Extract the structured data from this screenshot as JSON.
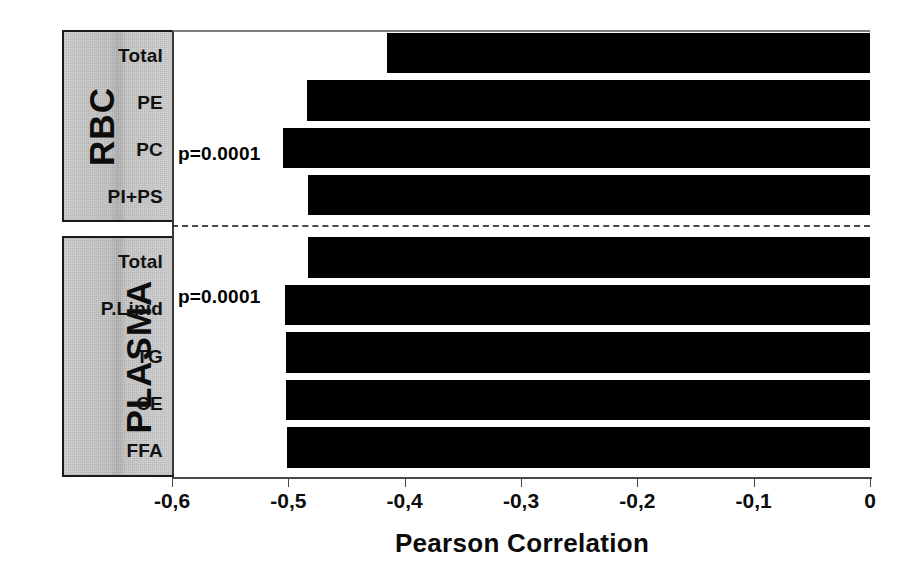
{
  "chart_data": {
    "type": "bar",
    "orientation": "horizontal",
    "title": "",
    "xlabel": "Pearson Correlation",
    "ylabel": "",
    "xlim": [
      -0.6,
      0
    ],
    "xticks": [
      -0.6,
      -0.5,
      -0.4,
      -0.3,
      -0.2,
      -0.1,
      0
    ],
    "xticklabels": [
      "-0,6",
      "-0,5",
      "-0,4",
      "-0,3",
      "-0,2",
      "-0,1",
      "0"
    ],
    "grid": false,
    "legend": null,
    "bar_color": "#000000",
    "decimal_separator_axis": ",",
    "groups": [
      {
        "name": "RBC",
        "categories": [
          "Total",
          "PE",
          "PC",
          "PI+PS"
        ],
        "values": [
          -0.415,
          -0.484,
          -0.505,
          -0.483
        ]
      },
      {
        "name": "PLASMA",
        "categories": [
          "Total",
          "P.Lipid",
          "TG",
          "CE",
          "FFA"
        ],
        "values": [
          -0.483,
          -0.503,
          -0.502,
          -0.502,
          -0.501
        ]
      }
    ],
    "categories": [
      "Total",
      "PE",
      "PC",
      "PI+PS",
      "Total",
      "P.Lipid",
      "TG",
      "CE",
      "FFA"
    ],
    "values": [
      -0.415,
      -0.484,
      -0.505,
      -0.483,
      -0.483,
      -0.503,
      -0.502,
      -0.502,
      -0.501
    ],
    "annotations": [
      {
        "text": "p=0.0001",
        "attached_to": "RBC / PC",
        "x": -0.6,
        "y_index": 2
      },
      {
        "text": "p=0.0001",
        "attached_to": "PLASMA / P.Lipid",
        "x": -0.6,
        "y_index": 5
      }
    ],
    "group_divider": {
      "style": "dash-dot",
      "between": [
        "RBC",
        "PLASMA"
      ]
    }
  },
  "figure": {
    "axis_title": "Pearson Correlation",
    "group_rbc_label": "RBC",
    "group_plasma_label": "PLASMA",
    "rbc_categories": [
      "Total",
      "PE",
      "PC",
      "PI+PS"
    ],
    "plasma_categories": [
      "Total",
      "P.Lipid",
      "TG",
      "CE",
      "FFA"
    ],
    "tick_labels": [
      "-0,6",
      "-0,5",
      "-0,4",
      "-0,3",
      "-0,2",
      "-0,1",
      "0"
    ],
    "pvalue_rbc": "p=0.0001",
    "pvalue_plasma": "p=0.0001",
    "colors": {
      "bar": "#000000",
      "label_block": "#cccccc",
      "axis": "#4a4a4a"
    }
  }
}
